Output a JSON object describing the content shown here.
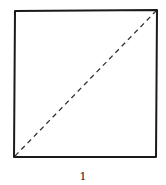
{
  "figure": {
    "label": "1",
    "shape": "square",
    "diagonal": "dashed, bottom-left to top-right",
    "stroke_color": "#1a1a1a",
    "background": "#ffffff"
  }
}
